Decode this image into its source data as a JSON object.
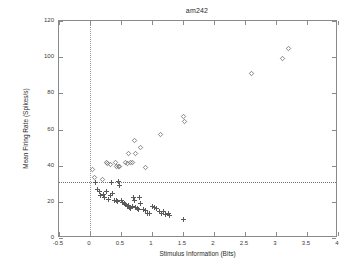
{
  "chart_data": {
    "type": "scatter",
    "title": "am242",
    "xlabel": "Stimulus Information (Bits)",
    "ylabel": "Mean Firing Rate (Spikes/s)",
    "xlim": [
      -0.5,
      4
    ],
    "ylim": [
      0,
      120
    ],
    "xticks": [
      -0.5,
      0,
      0.5,
      1,
      1.5,
      2,
      2.5,
      3,
      3.5,
      4
    ],
    "xticklabels": [
      "-0.5",
      "0",
      "0.5",
      "1",
      "1.5",
      "2",
      "2.5",
      "3",
      "3.5",
      "4"
    ],
    "yticks": [
      0,
      20,
      40,
      60,
      80,
      100,
      120
    ],
    "yticklabels": [
      "0",
      "20",
      "40",
      "60",
      "80",
      "100",
      "120"
    ],
    "grid": false,
    "legend": null,
    "reference_lines": [
      {
        "orientation": "vertical",
        "value": 0,
        "style": "dotted"
      },
      {
        "orientation": "horizontal",
        "value": 31,
        "style": "dotted"
      }
    ],
    "series": [
      {
        "name": "upper branch",
        "marker": "diamond",
        "points": [
          [
            0.04,
            38.0
          ],
          [
            0.07,
            33.5
          ],
          [
            0.2,
            32.5
          ],
          [
            0.26,
            41.5
          ],
          [
            0.28,
            41.0
          ],
          [
            0.33,
            40.5
          ],
          [
            0.41,
            41.5
          ],
          [
            0.43,
            39.5
          ],
          [
            0.46,
            39.5
          ],
          [
            0.48,
            39.5
          ],
          [
            0.57,
            41.5
          ],
          [
            0.6,
            41.0
          ],
          [
            0.62,
            46.5
          ],
          [
            0.65,
            41.5
          ],
          [
            0.68,
            41.5
          ],
          [
            0.72,
            54.0
          ],
          [
            0.74,
            46.5
          ],
          [
            0.82,
            50.0
          ],
          [
            0.9,
            39.0
          ],
          [
            1.13,
            57.0
          ],
          [
            1.5,
            67.0
          ],
          [
            1.52,
            64.5
          ],
          [
            2.6,
            91.0
          ],
          [
            3.1,
            99.5
          ],
          [
            3.2,
            105.0
          ]
        ]
      },
      {
        "name": "lower branch",
        "marker": "plus",
        "points": [
          [
            0.09,
            30.5
          ],
          [
            0.12,
            27.0
          ],
          [
            0.15,
            25.5
          ],
          [
            0.17,
            23.5
          ],
          [
            0.22,
            24.0
          ],
          [
            0.24,
            22.5
          ],
          [
            0.27,
            25.5
          ],
          [
            0.3,
            21.5
          ],
          [
            0.33,
            23.5
          ],
          [
            0.35,
            30.5
          ],
          [
            0.37,
            24.5
          ],
          [
            0.4,
            21.0
          ],
          [
            0.42,
            20.5
          ],
          [
            0.44,
            20.0
          ],
          [
            0.46,
            31.5
          ],
          [
            0.48,
            29.0
          ],
          [
            0.5,
            20.5
          ],
          [
            0.52,
            19.5
          ],
          [
            0.55,
            19.0
          ],
          [
            0.58,
            18.5
          ],
          [
            0.6,
            17.5
          ],
          [
            0.62,
            18.0
          ],
          [
            0.64,
            17.0
          ],
          [
            0.66,
            16.5
          ],
          [
            0.68,
            17.5
          ],
          [
            0.7,
            22.5
          ],
          [
            0.72,
            21.0
          ],
          [
            0.74,
            17.0
          ],
          [
            0.76,
            16.5
          ],
          [
            0.78,
            16.0
          ],
          [
            0.8,
            22.5
          ],
          [
            0.82,
            19.0
          ],
          [
            0.86,
            16.0
          ],
          [
            0.9,
            15.0
          ],
          [
            0.93,
            13.5
          ],
          [
            0.96,
            13.5
          ],
          [
            1.0,
            17.5
          ],
          [
            1.04,
            17.0
          ],
          [
            1.08,
            16.5
          ],
          [
            1.12,
            14.5
          ],
          [
            1.16,
            13.5
          ],
          [
            1.18,
            14.5
          ],
          [
            1.22,
            13.0
          ],
          [
            1.26,
            13.5
          ],
          [
            1.29,
            12.5
          ],
          [
            1.51,
            10.5
          ]
        ]
      }
    ]
  }
}
